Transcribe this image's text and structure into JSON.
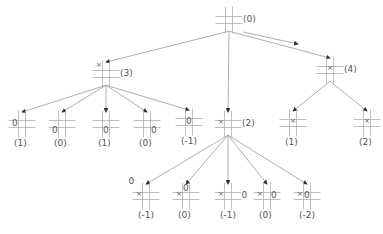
{
  "colors": {
    "line": "#9a9a9a",
    "grid": "#b0b0b0",
    "text": "#555555"
  },
  "nodes": [
    {
      "id": "root",
      "label": "(0)",
      "x": 229,
      "y": 20,
      "marks": []
    },
    {
      "id": "n3",
      "label": "(3)",
      "x": 106,
      "y": 74,
      "marks": [
        {
          "cell": 0,
          "sym": "×"
        }
      ]
    },
    {
      "id": "n2",
      "label": "(2)",
      "x": 228,
      "y": 124,
      "marks": [
        {
          "cell": 3,
          "sym": "×"
        }
      ]
    },
    {
      "id": "n4",
      "label": "(4)",
      "x": 330,
      "y": 70,
      "marks": [
        {
          "cell": 4,
          "sym": "×"
        }
      ]
    },
    {
      "id": "a1",
      "label": "(1)",
      "x": 22,
      "y": 124,
      "marks": [
        {
          "cell": 3,
          "sym": "0"
        }
      ]
    },
    {
      "id": "a2",
      "label": "(0)",
      "x": 62,
      "y": 124,
      "marks": [
        {
          "cell": 6,
          "sym": "0"
        }
      ]
    },
    {
      "id": "a3",
      "label": "(1)",
      "x": 106,
      "y": 124,
      "marks": [
        {
          "cell": 7,
          "sym": "0"
        }
      ]
    },
    {
      "id": "a4",
      "label": "(0)",
      "x": 147,
      "y": 124,
      "marks": [
        {
          "cell": 8,
          "sym": "0"
        }
      ]
    },
    {
      "id": "a5",
      "label": "(-1)",
      "x": 189,
      "y": 122,
      "marks": [
        {
          "cell": 4,
          "sym": "0"
        }
      ]
    },
    {
      "id": "c1",
      "label": "(1)",
      "x": 293,
      "y": 123,
      "marks": [
        {
          "cell": 4,
          "sym": "×"
        }
      ]
    },
    {
      "id": "c2",
      "label": "(2)",
      "x": 367,
      "y": 123,
      "marks": [
        {
          "cell": 4,
          "sym": "×"
        }
      ]
    },
    {
      "id": "b1",
      "label": "(-1)",
      "x": 146,
      "y": 196,
      "marks": [
        {
          "cell": "out-tl",
          "sym": "0"
        },
        {
          "cell": 3,
          "sym": "×"
        }
      ]
    },
    {
      "id": "b2",
      "label": "(0)",
      "x": 186,
      "y": 196,
      "marks": [
        {
          "cell": 1,
          "sym": "0"
        },
        {
          "cell": 3,
          "sym": "×"
        }
      ]
    },
    {
      "id": "b3",
      "label": "(-1)",
      "x": 228,
      "y": 196,
      "marks": [
        {
          "cell": "out-r",
          "sym": "0"
        },
        {
          "cell": 3,
          "sym": "×"
        }
      ]
    },
    {
      "id": "b4",
      "label": "(0)",
      "x": 267,
      "y": 196,
      "marks": [
        {
          "cell": 5,
          "sym": "0"
        },
        {
          "cell": 3,
          "sym": "×"
        }
      ]
    },
    {
      "id": "b5",
      "label": "(-2)",
      "x": 307,
      "y": 196,
      "marks": [
        {
          "cell": 4,
          "sym": "0"
        },
        {
          "cell": 3,
          "sym": "×"
        }
      ]
    }
  ],
  "edges": [
    [
      "root",
      "n3"
    ],
    [
      "root",
      "n2"
    ],
    [
      "root",
      "n4"
    ],
    [
      "n3",
      "a1"
    ],
    [
      "n3",
      "a2"
    ],
    [
      "n3",
      "a3"
    ],
    [
      "n3",
      "a4"
    ],
    [
      "n3",
      "a5"
    ],
    [
      "n4",
      "c1"
    ],
    [
      "n4",
      "c2"
    ],
    [
      "n2",
      "b1"
    ],
    [
      "n2",
      "b2"
    ],
    [
      "n2",
      "b3"
    ],
    [
      "n2",
      "b4"
    ],
    [
      "n2",
      "b5"
    ]
  ],
  "extra_arrow": {
    "from": [
      243,
      32
    ],
    "to": [
      298,
      44
    ]
  }
}
